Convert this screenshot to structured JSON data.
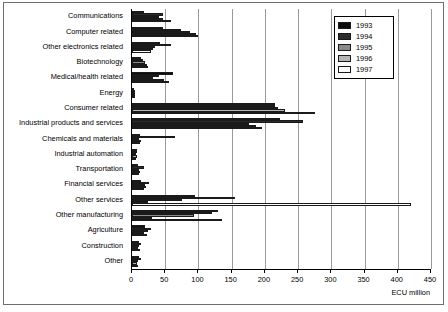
{
  "chart_data": {
    "type": "bar",
    "orientation": "horizontal",
    "title": "",
    "xlabel": "ECU million",
    "ylabel": "",
    "xlim": [
      0,
      450
    ],
    "xticks": [
      0,
      50,
      100,
      150,
      200,
      250,
      300,
      350,
      400,
      450
    ],
    "grid": true,
    "legend_position": "top-right",
    "categories": [
      "Communications",
      "Computer related",
      "Other electronics related",
      "Biotechnology",
      "Medical/health related",
      "Energy",
      "Consumer related",
      "Industrial products and services",
      "Chemicals and materials",
      "Industrial automation",
      "Transportation",
      "Financial services",
      "Other services",
      "Other manufacturing",
      "Agriculture",
      "Construction",
      "Other"
    ],
    "series": [
      {
        "name": "1993",
        "color": "#0d0d0d",
        "values": [
          18,
          46,
          42,
          13,
          62,
          3,
          215,
          222,
          12,
          8,
          9,
          13,
          95,
          130,
          20,
          10,
          11
        ]
      },
      {
        "name": "1994",
        "color": "#2b2b2b",
        "values": [
          47,
          74,
          58,
          16,
          40,
          4,
          215,
          258,
          65,
          7,
          18,
          26,
          155,
          120,
          28,
          13,
          14
        ]
      },
      {
        "name": "1995",
        "color": "#8a8a8a",
        "values": [
          40,
          88,
          35,
          20,
          32,
          4,
          220,
          176,
          10,
          6,
          10,
          20,
          76,
          94,
          24,
          11,
          9
        ]
      },
      {
        "name": "1996",
        "color": "#b5b5b5",
        "values": [
          46,
          96,
          31,
          23,
          48,
          5,
          231,
          186,
          14,
          7,
          12,
          21,
          24,
          30,
          18,
          9,
          8
        ]
      },
      {
        "name": "1997",
        "color": "#ffffff",
        "values": [
          58,
          99,
          28,
          24,
          55,
          5,
          275,
          195,
          12,
          6,
          11,
          18,
          420,
          135,
          22,
          12,
          9
        ]
      }
    ]
  },
  "legend": {
    "items": [
      {
        "label": "1993",
        "color": "#0d0d0d"
      },
      {
        "label": "1994",
        "color": "#2b2b2b"
      },
      {
        "label": "1995",
        "color": "#8a8a8a"
      },
      {
        "label": "1996",
        "color": "#b5b5b5"
      },
      {
        "label": "1997",
        "color": "#ffffff"
      }
    ]
  },
  "axis": {
    "title": "ECU million"
  }
}
